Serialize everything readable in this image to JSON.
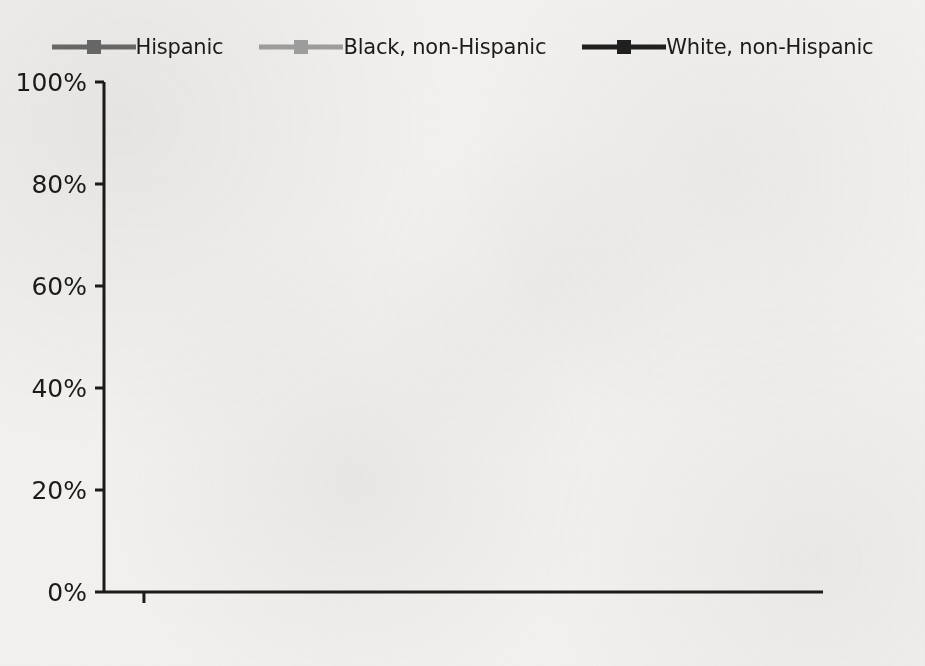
{
  "legend": {
    "position": "top-center",
    "entries": [
      {
        "label": "Hispanic",
        "color": "#6a6a6a",
        "marker": "square"
      },
      {
        "label": "Black, non-Hispanic",
        "color": "#a0a0a0",
        "marker": "square"
      },
      {
        "label": "White, non-Hispanic",
        "color": "#1f1f1f",
        "marker": "square"
      }
    ]
  },
  "axes": {
    "y_tick_labels": [
      "100%",
      "80%",
      "60%",
      "40%",
      "20%",
      "0%"
    ],
    "x_tick_labels": [
      "1972",
      "1976",
      "1980",
      "1984",
      "1988",
      "1992",
      "1996",
      "2000",
      "2004"
    ]
  },
  "chart_data": {
    "type": "line",
    "title": "",
    "xlabel": "",
    "ylabel": "",
    "xlim": [
      1970,
      2006
    ],
    "ylim": [
      0,
      100
    ],
    "grid": false,
    "legend_position": "top-center",
    "x": [
      1970,
      1974,
      1978,
      1982,
      1986,
      1990,
      1994,
      1998,
      2002,
      2006
    ],
    "x_ticks": [
      1972,
      1976,
      1980,
      1984,
      1988,
      1992,
      1996,
      2000,
      2004
    ],
    "y_ticks": [
      0,
      20,
      40,
      60,
      80,
      100
    ],
    "y_tick_labels": [
      "0%",
      "20%",
      "40%",
      "60%",
      "80%",
      "100%"
    ],
    "series": [
      {
        "name": "Hispanic",
        "color": "#6a6a6a",
        "marker": "square",
        "values": [
          36.5,
          44.0,
          41.5,
          47.5,
          42.5,
          45.0,
          40.0,
          50.0,
          45.5,
          58.5
        ]
      },
      {
        "name": "Black, non-Hispanic",
        "color": "#a0a0a0",
        "marker": "square",
        "values": [
          33.5,
          43.5,
          38.5,
          41.0,
          35.5,
          38.5,
          39.5,
          43.5,
          37.5,
          52.5
        ]
      },
      {
        "name": "White, non-Hispanic",
        "color": "#1f1f1f",
        "marker": "square",
        "values": [
          70.5,
          76.0,
          70.5,
          70.0,
          67.5,
          71.0,
          71.5,
          73.0,
          74.5,
          79.5
        ]
      }
    ]
  }
}
